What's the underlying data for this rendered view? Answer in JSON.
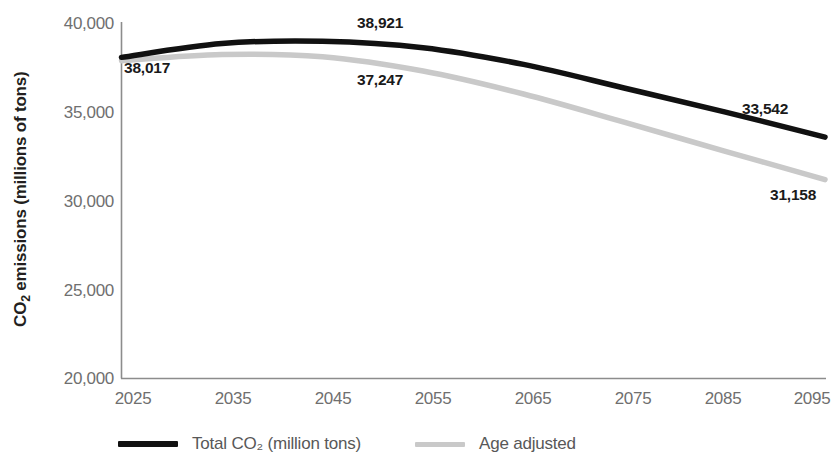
{
  "chart_data": {
    "type": "line",
    "title": "",
    "xlabel": "",
    "ylabel": "CO₂ emissions (millions of tons)",
    "x": [
      2025,
      2035,
      2045,
      2055,
      2065,
      2075,
      2085,
      2095
    ],
    "xtick_labels": [
      "2025",
      "2035",
      "2045",
      "2055",
      "2065",
      "2075",
      "2085",
      "2095"
    ],
    "ytick_labels": [
      "40,000",
      "35,000",
      "30,000",
      "25,000",
      "20,000"
    ],
    "ytick_values": [
      40000,
      35000,
      30000,
      25000,
      20000
    ],
    "xlim": [
      2025,
      2095
    ],
    "ylim": [
      20000,
      40000
    ],
    "grid": false,
    "legend_position": "bottom",
    "series": [
      {
        "name": "Total CO₂ (million tons)",
        "color": "#111111",
        "values": [
          38017,
          38790,
          38921,
          38560,
          37620,
          36300,
          34960,
          33542
        ]
      },
      {
        "name": "Age adjusted",
        "color": "#c9c9c9",
        "values": [
          37830,
          38180,
          38050,
          37247,
          35960,
          34380,
          32760,
          31158
        ]
      }
    ],
    "annotations": [
      {
        "text": "38,017",
        "series": "Total CO₂ (million tons)",
        "x": 2025,
        "value": 38017
      },
      {
        "text": "38,921",
        "series": "Total CO₂ (million tons)",
        "x": 2045,
        "value": 38921
      },
      {
        "text": "33,542",
        "series": "Total CO₂ (million tons)",
        "x": 2095,
        "value": 33542
      },
      {
        "text": "37,247",
        "series": "Age adjusted",
        "x": 2055,
        "value": 37247
      },
      {
        "text": "31,158",
        "series": "Age adjusted",
        "x": 2095,
        "value": 31158
      }
    ]
  },
  "axis": {
    "y_title": "CO₂ emissions (millions of tons)",
    "y_ticks": [
      "40,000",
      "35,000",
      "30,000",
      "25,000",
      "20,000"
    ],
    "x_ticks": [
      "2025",
      "2035",
      "2045",
      "2055",
      "2065",
      "2075",
      "2085",
      "2095"
    ]
  },
  "labels": {
    "start_total": "38,017",
    "peak_total": "38,921",
    "end_total": "33,542",
    "mid_age": "37,247",
    "end_age": "31,158"
  },
  "legend": {
    "items": [
      {
        "label": "Total CO₂ (million tons)",
        "color": "#111111"
      },
      {
        "label": "Age adjusted",
        "color": "#c9c9c9"
      }
    ],
    "total_label": "Total CO₂ (million tons)",
    "age_label": "Age adjusted"
  },
  "colors": {
    "total_line": "#111111",
    "age_line": "#c9c9c9",
    "axis": "#8c8c8c",
    "tick_text": "#6f6f6f",
    "title_text": "#231f20"
  }
}
